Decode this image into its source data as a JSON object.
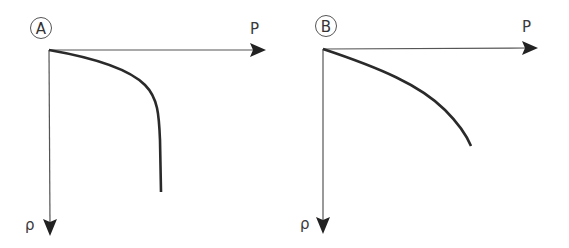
{
  "panels": [
    {
      "id": "A",
      "badge": "A",
      "x_axis_label": "P",
      "y_axis_label": "ρ",
      "curve": "concave decline that turns sharply vertical (asymptote)"
    },
    {
      "id": "B",
      "badge": "B",
      "x_axis_label": "P",
      "y_axis_label": "ρ",
      "curve": "smooth gradual concave decline"
    }
  ],
  "colors": {
    "axis": "#555555",
    "curve": "#2a2a2a",
    "text": "#3a3a3a"
  }
}
